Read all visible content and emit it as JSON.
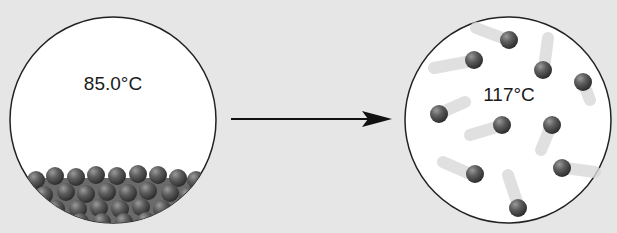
{
  "diagram": {
    "left_panel": {
      "temperature_label": "85.0°C",
      "state": "liquid"
    },
    "right_panel": {
      "temperature_label": "117°C",
      "state": "gas"
    },
    "arrow": {
      "direction": "right"
    },
    "colors": {
      "background": "#e6e6e6",
      "circle_fill": "#ffffff",
      "outline": "#222222",
      "particle": "#5a5a5a"
    }
  }
}
